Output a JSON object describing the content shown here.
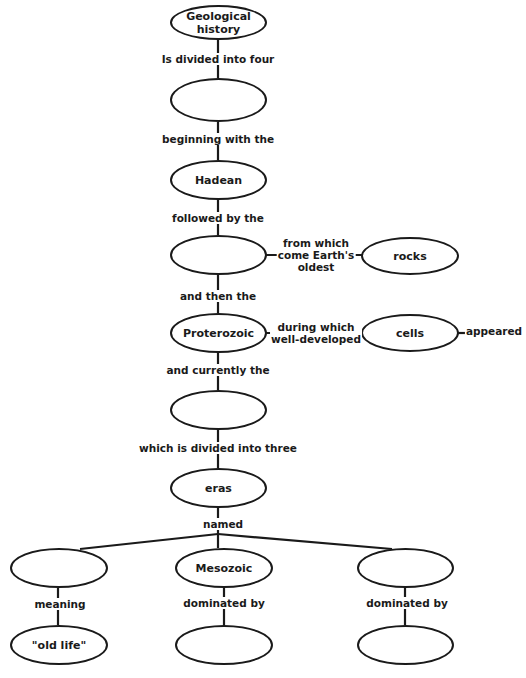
{
  "diagram": {
    "type": "concept-map",
    "nodes": {
      "root": "Geological history",
      "eons_blank": "",
      "hadean": "Hadean",
      "archean_blank": "",
      "rocks": "rocks",
      "proterozoic": "Proterozoic",
      "cells": "cells",
      "current_blank": "",
      "eras": "eras",
      "era_left_blank": "",
      "mesozoic": "Mesozoic",
      "era_right_blank": "",
      "old_life": "\"old life\"",
      "mesozoic_dominated_blank": "",
      "right_dominated_blank": ""
    },
    "links": {
      "divided_four": "Is divided into four",
      "beginning_with": "beginning with the",
      "followed_by": "followed by the",
      "from_which_1": "from which",
      "from_which_2": "come Earth's",
      "from_which_3": "oldest",
      "and_then": "and then the",
      "during_which_1": "during which",
      "during_which_2": "well-developed",
      "appeared": "appeared",
      "and_currently": "and currently the",
      "divided_three": "which is divided into three",
      "named": "named",
      "meaning": "meaning",
      "dominated_by_mid": "dominated by",
      "dominated_by_right": "dominated by"
    }
  }
}
